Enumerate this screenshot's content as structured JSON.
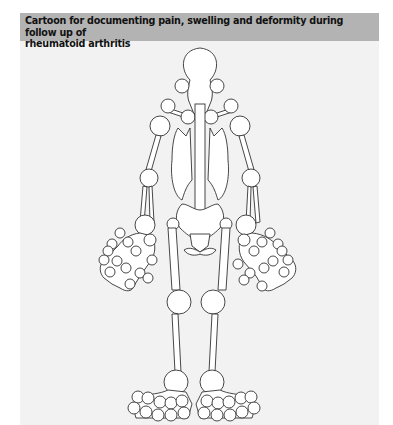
{
  "figure": {
    "title": "Cartoon for documenting pain, swelling and deformity during follow up of rheumatoid arthritis",
    "title_line1": "Cartoon for documenting pain, swelling and deformity during follow up of",
    "title_line2": "rheumatoid arthritis",
    "colors": {
      "header_bg": "#b3b3b3",
      "panel_bg": "#f2f2f2",
      "outline": "#333333",
      "joint_fill": "#ffffff"
    },
    "diagram": {
      "subject": "skeleton-front-view",
      "joints": [
        "temporomandibular-left",
        "temporomandibular-right",
        "sternoclavicular-left",
        "sternoclavicular-right",
        "acromioclavicular-left",
        "acromioclavicular-right",
        "shoulder-left",
        "shoulder-right",
        "elbow-left",
        "elbow-right",
        "wrist-left",
        "wrist-right",
        "hand-left",
        "hand-right",
        "knee-left",
        "knee-right",
        "ankle-left",
        "ankle-right",
        "foot-left",
        "foot-right"
      ]
    }
  }
}
